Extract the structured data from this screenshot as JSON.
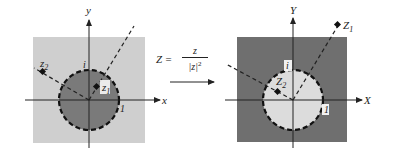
{
  "mapping": {
    "lhs": "Z =",
    "numerator": "z",
    "denominator": "|z|",
    "exponent": "2",
    "arrow": "right-arrow"
  },
  "left_plane": {
    "x_axis_label": "x",
    "y_axis_label": "y",
    "unit_real_label": "1",
    "unit_imag_label": "i",
    "point_inside_label": "z",
    "point_inside_subscript": "1",
    "point_outside_label": "z",
    "point_outside_subscript": "2",
    "disk_fill": "#7a7a7a",
    "outside_fill": "#cfcfcf"
  },
  "right_plane": {
    "x_axis_label": "X",
    "y_axis_label": "Y",
    "unit_real_label": "1",
    "unit_imag_label": "i",
    "point_outside_label": "Z",
    "point_outside_subscript": "1",
    "point_inside_label": "Z",
    "point_inside_subscript": "2",
    "disk_fill": "#dcdcdc",
    "outside_fill": "#6f6f6f"
  }
}
